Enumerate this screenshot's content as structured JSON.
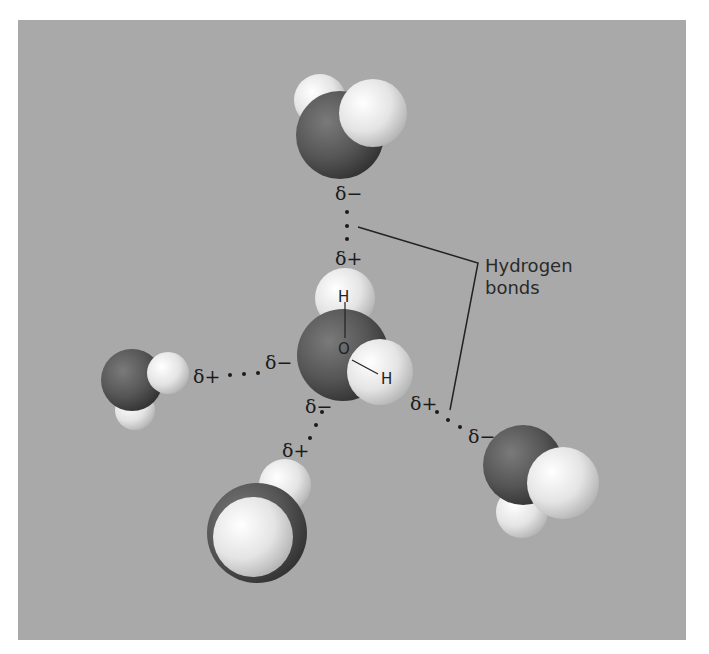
{
  "figure": {
    "background_color": "#a9a9a9",
    "oxygen_color": "#5a5a5a",
    "hydrogen_color": "#e8e8e8",
    "callout": {
      "line1": "Hydrogen",
      "line2": "bonds"
    },
    "central_molecule": {
      "atom_o": "O",
      "atom_h_top": "H",
      "atom_h_right": "H",
      "charge_bottom_left": "δ−",
      "charge_top": "δ+",
      "charge_left": "δ−",
      "charge_right": "δ+"
    },
    "top_molecule": {
      "charge": "δ−"
    },
    "left_molecule": {
      "charge": "δ+"
    },
    "bottom_molecule": {
      "charge": "δ+"
    },
    "right_molecule": {
      "charge": "δ−"
    }
  }
}
